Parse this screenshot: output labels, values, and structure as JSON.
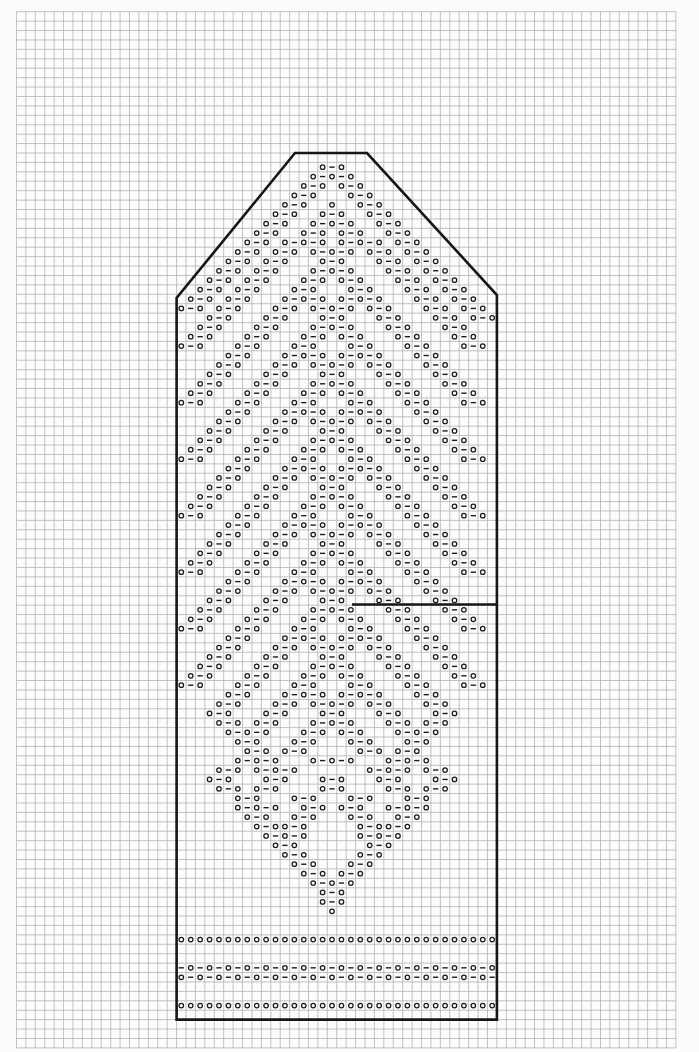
{
  "app": {
    "title": "knitting-lace-chart",
    "description": "Mitten-shaped knitting chart on graph paper, symbols o and - forming lace lattice"
  },
  "chart_data": {
    "type": "knitting-chart",
    "columns": 34,
    "rows_total": 92,
    "cell_size": 9.42,
    "origin": {
      "x": 176.6,
      "y": 153.0
    },
    "legend": {
      "o": "yarnover",
      "-": "decrease",
      ".": "empty"
    },
    "outline": {
      "top_flat": {
        "x1": 295,
        "x2": 367,
        "y": 153
      },
      "left_corner": {
        "x": 176.6,
        "y": 298
      },
      "right_corner": {
        "x": 496.9,
        "y": 295
      },
      "bottom_y": 1019.6,
      "left_x": 176.6,
      "right_x": 496.9,
      "thumb_line": {
        "x1": 352,
        "x2": 496.9,
        "y": 604.5
      }
    },
    "grid": {
      "v_from": -17,
      "v_to": 53,
      "h_from": -15,
      "h_to": 95,
      "color": "#b3b3b3",
      "width": 0.8
    },
    "colors": {
      "background": "#fcfcfc",
      "outline": "#161616",
      "symbol": "#1c1c1c"
    },
    "rows": [
      "..................................",
      "...............o-o................",
      "..............o-o-o...............",
      ".............o-o.o-o..............",
      "............o-o...o-o.............",
      "...........o-o..o..o-o............",
      "..........o-o..o-o..o-o...........",
      ".........o-o..o-o-o..o-o..........",
      "........o-o..o-o.o-o..o-o.........",
      ".......o-o.o-o-o.o-o-o.o-o........",
      "......o-o.o-o.o-o-o.o-o.o-o.......",
      ".....o-o.o-o...o-o...o-o.o-o......",
      "....o-o.o-o...o-o-o...o-o.o-o.....",
      "...o-o.o-o...o-o.o-o...o-o.o-o....",
      "..o-o.o-o...o-o...o-o...o-o.o-o...",
      ".o-o.o-o...o-o-o.o-o-o...o-o.o-o..",
      "o-o.o-o...o-o.o-o-o.o-o...o-o.o-o.",
      "...o-o...o-o...o-o...o-o...o-o.o-o",
      "..o-o...o-o...o-o-o...o-o...o-o...",
      ".o-o...o-o...o-o.o-o...o-o...o-o..",
      "o-o...o-o...o-o...o-o...o-o...o-o.",
      ".....o-o...o-o-o.o-o-o...o-o......",
      "....o-o...o-o.o-o-o.o-o...o-o.....",
      "...o-o...o-o...o-o...o-o...o-o....",
      "..o-o...o-o...o-o-o...o-o...o-o...",
      ".o-o...o-o...o-o.o-o...o-o...o-o..",
      "o-o...o-o...o-o...o-o...o-o...o-o.",
      ".....o-o...o-o-o.o-o-o...o-o......",
      "....o-o...o-o.o-o-o.o-o...o-o.....",
      "...o-o...o-o...o-o...o-o...o-o....",
      "..o-o...o-o...o-o-o...o-o...o-o...",
      ".o-o...o-o...o-o.o-o...o-o...o-o..",
      "o-o...o-o...o-o...o-o...o-o...o-o.",
      ".....o-o...o-o-o.o-o-o...o-o......",
      "....o-o...o-o.o-o-o.o-o...o-o.....",
      "...o-o...o-o...o-o...o-o...o-o....",
      "..o-o...o-o...o-o-o...o-o...o-o...",
      ".o-o...o-o...o-o.o-o...o-o...o-o..",
      "o-o...o-o...o-o...o-o...o-o...o-o.",
      ".....o-o...o-o-o.o-o-o...o-o......",
      "....o-o...o-o.o-o-o.o-o...o-o.....",
      "...o-o...o-o...o-o...o-o...o-o....",
      "..o-o...o-o...o-o-o...o-o...o-o...",
      ".o-o...o-o...o-o.o-o...o-o...o-o..",
      "o-o...o-o...o-o...o-o...o-o...o-o.",
      ".....o-o...o-o-o.o-o-o...o-o......",
      "....o-o...o-o.o-o-o.o-o...o-o.....",
      "...o-o...o-o...o-o...o-o...o-o....",
      "..o-o...o-o...o-o-o...o-o...o-o...",
      ".o-o...o-o...o-o.o-o...o-o...o-o..",
      "o-o...o-o...o-o...o-o...o-o...o-o.",
      ".....o-o...o-o-o.o-o-o...o-o......",
      "....o-o...o-o.o-o-o.o-o...o-o.....",
      "...o-o...o-o...o-o...o-o...o-o....",
      "..o-o...o-o...o-o-o...o-o...o-o...",
      ".o-o...o-o...o-o.o-o...o-o...o-o..",
      "o-o...o-o...o-o...o-o...o-o...o-o.",
      ".....o-o...o-o-o.o-o-o...o-o......",
      "....o-o...o-o.o-o-o.o-o...o-o.....",
      "...o-o...o-o...o-o...o-o...o-o....",
      "....o-o.o-o...o-o-o...o-o.o-o.....",
      ".....o-o-o...o-o.o-o...o-o-o......",
      "......o-o...o-o...o-o...o-o.......",
      ".......o-o.o-o.....o-o.o-o........",
      "......o-o-o...o-o-o...o-o-o.......",
      "....o-o.o-o-o.......o-o-o.o-o.....",
      "...o-o...o-o...o-o...o-o...o-o....",
      "....o-o.o-o....o-o....o-o.o-o.....",
      "......o-o...o-o...o-o...o-o.......",
      "......o-o-o..o-o.o-o..o-o-o.......",
      ".......o-o..o-o...o-o..o-o........",
      "........o-oo-o.....o-oo-o.........",
      ".........o-o-o.....o-o-o..........",
      "..........o-o.......o-o...........",
      "...........o-o.....o-o............",
      "............o-o...o-o.............",
      ".............o-o.o-o..............",
      "..............o-o-o...............",
      "...............o-o................",
      "...............o-o................",
      "................o.................",
      "..................................",
      "..................................",
      "oooooooooooooooooooooooooooooooooo",
      "..................................",
      "..................................",
      "-o-o-o-o-o-o-o-o-o-o-o-o-o-o-o-o-o",
      "o-o-o-o-o-o-o-o-o-o-o-o-o-o-o-o-o-",
      "..................................",
      "..................................",
      "oooooooooooooooooooooooooooooooooo",
      ".................................."
    ]
  }
}
